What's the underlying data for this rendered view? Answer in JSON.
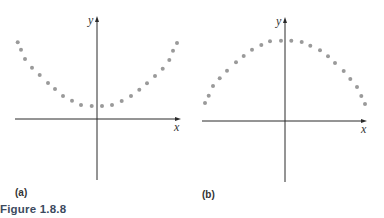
{
  "figure": {
    "caption": "Figure 1.8.8",
    "dot_color": "#9a9a9a",
    "axis_color": "#2a2a2a",
    "caption_color": "#3c4a5e"
  },
  "panels": [
    {
      "label": "(a)",
      "x_axis_label": "x",
      "y_axis_label": "y",
      "shape": "upward-opening parabola (concave up), vertex above x-axis"
    },
    {
      "label": "(b)",
      "x_axis_label": "x",
      "y_axis_label": "y",
      "shape": "downward-opening parabola (concave down), vertex above x-axis"
    }
  ],
  "chart_data": [
    {
      "type": "scatter",
      "title": "(a)",
      "xlabel": "x",
      "ylabel": "y",
      "grid": false,
      "axes_origin_px": [
        97,
        119
      ],
      "points_px": [
        [
          17.7,
          42.3
        ],
        [
          21,
          49.7
        ],
        [
          25,
          59
        ],
        [
          32,
          67.7
        ],
        [
          39.7,
          75
        ],
        [
          48,
          83
        ],
        [
          55,
          89
        ],
        [
          63,
          96
        ],
        [
          72,
          100.7
        ],
        [
          81,
          105
        ],
        [
          91.7,
          106
        ],
        [
          102,
          106
        ],
        [
          112,
          105
        ],
        [
          121.7,
          101
        ],
        [
          131,
          96
        ],
        [
          139.3,
          89.7
        ],
        [
          147,
          83.3
        ],
        [
          155,
          76
        ],
        [
          162.7,
          68.7
        ],
        [
          169.3,
          60
        ],
        [
          173,
          50.7
        ],
        [
          177,
          43
        ]
      ]
    },
    {
      "type": "scatter",
      "title": "(b)",
      "xlabel": "x",
      "ylabel": "y",
      "grid": false,
      "axes_origin_px": [
        285,
        121
      ],
      "points_px": [
        [
          205,
          103
        ],
        [
          208.7,
          95.7
        ],
        [
          213,
          86
        ],
        [
          219.7,
          78.3
        ],
        [
          227,
          70.7
        ],
        [
          236,
          62.3
        ],
        [
          243.7,
          56
        ],
        [
          252,
          49.7
        ],
        [
          261.3,
          45
        ],
        [
          270,
          41.3
        ],
        [
          281,
          40.7
        ],
        [
          291.3,
          40.7
        ],
        [
          301.7,
          42
        ],
        [
          310.3,
          45.7
        ],
        [
          320,
          50.3
        ],
        [
          328,
          56.3
        ],
        [
          335,
          63
        ],
        [
          343.7,
          71
        ],
        [
          350.3,
          79
        ],
        [
          357,
          87
        ],
        [
          361.3,
          96
        ],
        [
          365,
          104
        ]
      ]
    }
  ]
}
